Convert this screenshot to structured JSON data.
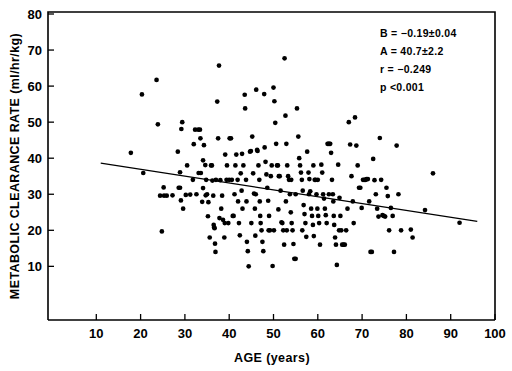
{
  "chart_data": {
    "type": "scatter",
    "title": "",
    "xlabel": "AGE (years)",
    "ylabel": "METABOLIC CLEARANCE RATE (ml/hr/kg)",
    "xlim": [
      0,
      100
    ],
    "ylim": [
      0,
      80
    ],
    "xticks": [
      10,
      20,
      30,
      40,
      50,
      60,
      70,
      80,
      90,
      100
    ],
    "yticks": [
      10,
      20,
      30,
      40,
      50,
      60,
      70,
      80
    ],
    "grid": false,
    "legend": null,
    "marker": "filled-circle",
    "marker_color": "#000000",
    "fit_line": {
      "type": "linear-regression",
      "slope": -0.19,
      "intercept": 40.7,
      "x_start": 11,
      "x_end": 96,
      "color": "#000000"
    },
    "annotations": {
      "position": "top-right",
      "lines": [
        "B  =  −0.19±0.04",
        "A  =  40.7±2.2",
        "r  =  −0.249",
        "p  <0.001"
      ],
      "slope_label": "B  =  −0.19±0.04",
      "intercept_label": "A  =  40.7±2.2",
      "correlation_label": "r  =  −0.249",
      "pvalue_label": "p  <0.001"
    },
    "points": [
      [
        17.8,
        41.5
      ],
      [
        20.3,
        57.7
      ],
      [
        20.6,
        35.9
      ],
      [
        23.6,
        61.7
      ],
      [
        23.9,
        49.4
      ],
      [
        24.4,
        29.6
      ],
      [
        24.8,
        19.7
      ],
      [
        25.3,
        29.6
      ],
      [
        25.9,
        29.6
      ],
      [
        25.2,
        31.9
      ],
      [
        27.2,
        29.7
      ],
      [
        28.4,
        41.8
      ],
      [
        28.6,
        31.8
      ],
      [
        28.9,
        31.8
      ],
      [
        28.9,
        36.1
      ],
      [
        29.2,
        48.1
      ],
      [
        29.4,
        50.0
      ],
      [
        29.1,
        28.3
      ],
      [
        29.6,
        26.0
      ],
      [
        30.2,
        29.8
      ],
      [
        31.2,
        29.9
      ],
      [
        32.0,
        43.9
      ],
      [
        32.3,
        47.9
      ],
      [
        33.0,
        47.9
      ],
      [
        33.4,
        47.9
      ],
      [
        33.1,
        35.9
      ],
      [
        33.6,
        35.9
      ],
      [
        33.5,
        45.5
      ],
      [
        33.9,
        27.9
      ],
      [
        34.1,
        39.4
      ],
      [
        34.3,
        43.6
      ],
      [
        34.6,
        38.1
      ],
      [
        34.1,
        31.7
      ],
      [
        34.7,
        29.7
      ],
      [
        35.2,
        23.9
      ],
      [
        35.3,
        27.8
      ],
      [
        35.6,
        18.0
      ],
      [
        35.9,
        38.0
      ],
      [
        36.1,
        38.0
      ],
      [
        36.2,
        33.8
      ],
      [
        36.4,
        29.6
      ],
      [
        36.5,
        21.5
      ],
      [
        36.6,
        20.8
      ],
      [
        36.7,
        20.6
      ],
      [
        36.8,
        16.3
      ],
      [
        36.9,
        14.0
      ],
      [
        37.3,
        55.7
      ],
      [
        37.5,
        45.5
      ],
      [
        37.7,
        65.7
      ],
      [
        37.8,
        23.4
      ],
      [
        38.0,
        33.9
      ],
      [
        38.4,
        29.6
      ],
      [
        38.6,
        22.9
      ],
      [
        38.9,
        18.0
      ],
      [
        39.1,
        41.0
      ],
      [
        39.4,
        34.0
      ],
      [
        39.5,
        38.0
      ],
      [
        40.1,
        45.5
      ],
      [
        40.4,
        45.5
      ],
      [
        40.6,
        34.0
      ],
      [
        40.8,
        24.0
      ],
      [
        41.0,
        24.0
      ],
      [
        41.4,
        38.0
      ],
      [
        41.6,
        41.0
      ],
      [
        41.9,
        34.0
      ],
      [
        42.0,
        28.0
      ],
      [
        42.2,
        22.0
      ],
      [
        42.4,
        18.6
      ],
      [
        42.6,
        35.8
      ],
      [
        42.9,
        41.2
      ],
      [
        43.2,
        38.0
      ],
      [
        43.5,
        57.6
      ],
      [
        43.6,
        53.8
      ],
      [
        43.8,
        34.0
      ],
      [
        43.9,
        28.0
      ],
      [
        44.0,
        16.8
      ],
      [
        44.2,
        14.2
      ],
      [
        44.4,
        10.0
      ],
      [
        44.7,
        41.8
      ],
      [
        44.9,
        42.0
      ],
      [
        45.2,
        46.0
      ],
      [
        45.4,
        35.8
      ],
      [
        45.6,
        30.2
      ],
      [
        45.8,
        26.0
      ],
      [
        45.9,
        18.5
      ],
      [
        46.1,
        59.0
      ],
      [
        46.3,
        42.3
      ],
      [
        46.4,
        42.0
      ],
      [
        46.6,
        38.0
      ],
      [
        46.8,
        34.0
      ],
      [
        46.9,
        28.0
      ],
      [
        47.1,
        22.0
      ],
      [
        47.3,
        20.0
      ],
      [
        47.5,
        16.8
      ],
      [
        47.7,
        14.2
      ],
      [
        47.9,
        57.8
      ],
      [
        48.0,
        43.0
      ],
      [
        48.2,
        39.0
      ],
      [
        48.4,
        35.5
      ],
      [
        48.6,
        31.8
      ],
      [
        48.8,
        28.2
      ],
      [
        49.0,
        24.0
      ],
      [
        49.2,
        20.0
      ],
      [
        49.4,
        35.0
      ],
      [
        49.6,
        38.0
      ],
      [
        49.8,
        10.1
      ],
      [
        50.0,
        59.6
      ],
      [
        50.2,
        55.8
      ],
      [
        50.4,
        49.8
      ],
      [
        50.6,
        44.0
      ],
      [
        50.8,
        38.0
      ],
      [
        51.0,
        38.0
      ],
      [
        51.2,
        35.0
      ],
      [
        51.4,
        35.0
      ],
      [
        51.6,
        31.0
      ],
      [
        51.8,
        22.2
      ],
      [
        52.0,
        22.0
      ],
      [
        52.2,
        20.0
      ],
      [
        52.4,
        16.0
      ],
      [
        52.5,
        67.7
      ],
      [
        52.7,
        51.8
      ],
      [
        52.9,
        44.0
      ],
      [
        53.1,
        38.0
      ],
      [
        53.3,
        35.0
      ],
      [
        53.5,
        34.0
      ],
      [
        53.7,
        30.0
      ],
      [
        53.9,
        25.0
      ],
      [
        54.1,
        22.0
      ],
      [
        54.3,
        20.0
      ],
      [
        54.5,
        16.2
      ],
      [
        54.7,
        12.1
      ],
      [
        55.0,
        12.1
      ],
      [
        55.3,
        53.8
      ],
      [
        55.6,
        46.0
      ],
      [
        55.8,
        40.0
      ],
      [
        56.0,
        38.0
      ],
      [
        56.2,
        36.0
      ],
      [
        56.4,
        34.0
      ],
      [
        56.6,
        31.0
      ],
      [
        56.8,
        27.0
      ],
      [
        57.0,
        24.5
      ],
      [
        57.2,
        22.0
      ],
      [
        57.4,
        18.2
      ],
      [
        57.6,
        41.8
      ],
      [
        57.9,
        36.0
      ],
      [
        58.1,
        34.2
      ],
      [
        58.3,
        30.8
      ],
      [
        58.5,
        26.0
      ],
      [
        58.7,
        24.0
      ],
      [
        58.9,
        21.5
      ],
      [
        59.1,
        18.4
      ],
      [
        59.3,
        34.0
      ],
      [
        59.5,
        34.0
      ],
      [
        59.7,
        30.0
      ],
      [
        59.9,
        26.0
      ],
      [
        60.1,
        24.0
      ],
      [
        60.3,
        22.0
      ],
      [
        60.5,
        16.0
      ],
      [
        60.8,
        38.2
      ],
      [
        61.0,
        36.0
      ],
      [
        61.2,
        30.0
      ],
      [
        61.4,
        28.8
      ],
      [
        61.6,
        26.0
      ],
      [
        61.8,
        24.2
      ],
      [
        62.0,
        22.0
      ],
      [
        62.2,
        44.0
      ],
      [
        62.4,
        44.0
      ],
      [
        62.6,
        44.0
      ],
      [
        62.8,
        44.0
      ],
      [
        63.0,
        41.5
      ],
      [
        63.2,
        34.0
      ],
      [
        63.4,
        30.0
      ],
      [
        63.5,
        28.0
      ],
      [
        63.7,
        21.5
      ],
      [
        63.9,
        18.0
      ],
      [
        64.1,
        16.0
      ],
      [
        64.3,
        10.4
      ],
      [
        64.6,
        38.2
      ],
      [
        64.9,
        29.0
      ],
      [
        65.1,
        24.0
      ],
      [
        65.3,
        20.0
      ],
      [
        65.5,
        16.0
      ],
      [
        65.8,
        16.0
      ],
      [
        66.1,
        16.0
      ],
      [
        66.4,
        20.0
      ],
      [
        66.7,
        26.0
      ],
      [
        67.0,
        50.0
      ],
      [
        67.3,
        43.8
      ],
      [
        67.6,
        35.0
      ],
      [
        67.9,
        28.0
      ],
      [
        68.1,
        22.0
      ],
      [
        68.4,
        51.3
      ],
      [
        68.7,
        43.5
      ],
      [
        69.0,
        38.0
      ],
      [
        69.3,
        31.8
      ],
      [
        69.6,
        31.8
      ],
      [
        69.9,
        26.2
      ],
      [
        70.2,
        34.0
      ],
      [
        70.5,
        34.0
      ],
      [
        70.8,
        34.0
      ],
      [
        71.0,
        34.2
      ],
      [
        71.3,
        34.2
      ],
      [
        71.6,
        28.0
      ],
      [
        71.9,
        14.0
      ],
      [
        72.2,
        14.0
      ],
      [
        72.5,
        39.8
      ],
      [
        72.8,
        33.9
      ],
      [
        73.1,
        30.0
      ],
      [
        73.4,
        26.0
      ],
      [
        73.7,
        23.8
      ],
      [
        74.0,
        45.6
      ],
      [
        74.3,
        34.0
      ],
      [
        74.6,
        24.2
      ],
      [
        74.9,
        24.0
      ],
      [
        75.2,
        23.8
      ],
      [
        75.5,
        31.8
      ],
      [
        75.8,
        29.5
      ],
      [
        76.1,
        20.0
      ],
      [
        76.5,
        26.2
      ],
      [
        76.9,
        24.0
      ],
      [
        77.2,
        14.0
      ],
      [
        77.8,
        43.5
      ],
      [
        78.2,
        30.0
      ],
      [
        78.8,
        20.0
      ],
      [
        81.0,
        20.2
      ],
      [
        81.4,
        18.0
      ],
      [
        84.2,
        25.6
      ],
      [
        86.0,
        35.8
      ],
      [
        92.0,
        22.1
      ],
      [
        30.5,
        38.0
      ],
      [
        31.8,
        34.0
      ],
      [
        32.6,
        30.0
      ],
      [
        34.8,
        34.0
      ],
      [
        35.0,
        30.0
      ],
      [
        37.0,
        34.0
      ],
      [
        38.2,
        26.0
      ],
      [
        39.0,
        22.0
      ],
      [
        39.8,
        22.0
      ],
      [
        40.0,
        34.0
      ],
      [
        41.2,
        30.0
      ],
      [
        42.8,
        31.0
      ],
      [
        43.0,
        26.0
      ],
      [
        45.0,
        22.0
      ],
      [
        46.0,
        30.0
      ],
      [
        47.0,
        24.0
      ],
      [
        48.9,
        20.0
      ],
      [
        50.1,
        20.0
      ],
      [
        51.1,
        25.8
      ],
      [
        52.8,
        28.0
      ],
      [
        53.0,
        20.0
      ],
      [
        54.0,
        34.0
      ],
      [
        55.0,
        30.0
      ],
      [
        56.5,
        20.0
      ],
      [
        58.0,
        30.0
      ],
      [
        59.0,
        38.0
      ],
      [
        60.0,
        34.0
      ],
      [
        62.5,
        30.0
      ],
      [
        63.6,
        24.0
      ],
      [
        64.8,
        20.0
      ]
    ]
  }
}
